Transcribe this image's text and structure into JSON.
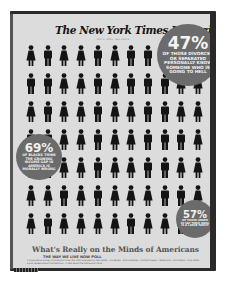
{
  "magazine": {
    "masthead": "The New York Times Magazine",
    "dateline": "MAY 1, 2005 · SECTION 6"
  },
  "stats": [
    {
      "id": "47",
      "percent": "47%",
      "caption": "of those divorced or separated personally know someone who is going to hell"
    },
    {
      "id": "69",
      "percent": "69%",
      "caption": "of blacks think the growing income gap in America is morally wrong"
    },
    {
      "id": "57",
      "percent": "57%",
      "caption": "of those under 30 say their ideal is a large family"
    }
  ],
  "cover_lines": {
    "headline": "What's Really on the Minds of Americans",
    "kicker": "THE WAY WE LIVE NOW POLL",
    "byline": "A provocative survey of America's inner life. With analyses by Alan Wolfe · Ann Banks · Kurt Andersen · Richard Powers · Walter Kirn · and others · Plus: What a poll reveals about contradiction · A talk about the future and more."
  },
  "figure_grid": {
    "columns": 11,
    "rows": 7,
    "pattern": [
      "FMFFMFMMFFF",
      "MMFFMFMMMFF",
      "FMFFMFFMMFF",
      "MMFFMFFMMMF",
      "FMFFMFFMMFF",
      "FFMFMFFFMMF",
      "FMFFFFMFFMF"
    ]
  },
  "colors": {
    "cover_bg": "#dcdcdc",
    "figure": "#141414",
    "badge": "#6b6b6b",
    "headline": "#555555"
  }
}
